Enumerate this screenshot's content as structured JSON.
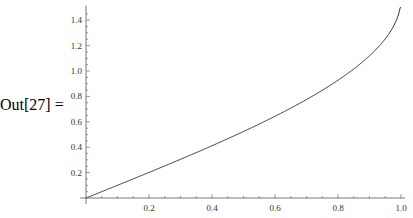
{
  "cell": {
    "out_label": "Out[27] ="
  },
  "chart_data": {
    "type": "line",
    "title": "",
    "xlabel": "",
    "ylabel": "",
    "function": "arcsin(x)",
    "xlim": [
      0,
      1.0
    ],
    "ylim": [
      0,
      1.5
    ],
    "grid": false,
    "x_ticks": [
      "0.2",
      "0.4",
      "0.6",
      "0.8",
      "1.0"
    ],
    "y_ticks": [
      "0.2",
      "0.4",
      "0.6",
      "0.8",
      "1.0",
      "1.2",
      "1.4"
    ],
    "series": [
      {
        "name": "curve",
        "x": [
          0,
          0.1,
          0.2,
          0.3,
          0.4,
          0.5,
          0.6,
          0.7,
          0.8,
          0.9,
          0.95,
          0.98,
          0.995,
          1.0
        ],
        "y": [
          0,
          0.1,
          0.201,
          0.305,
          0.412,
          0.524,
          0.644,
          0.775,
          0.927,
          1.12,
          1.253,
          1.371,
          1.471,
          1.5
        ]
      }
    ]
  }
}
